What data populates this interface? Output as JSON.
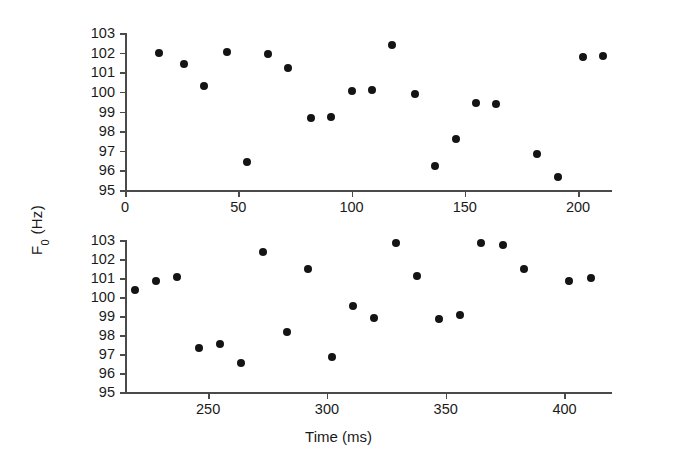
{
  "chart_data": {
    "type": "scatter",
    "title": "",
    "xlabel": "Time (ms)",
    "ylabel": "F0 (Hz)",
    "ylabel_base": "F",
    "ylabel_sub": "0",
    "ylabel_unit": " (Hz)",
    "grid": false,
    "legend": "none",
    "marker": "filled-circle",
    "marker_color": "#141414",
    "axis_color": "#4a4a4a",
    "panels": [
      {
        "name": "top-panel",
        "xlim": [
          0,
          215
        ],
        "ylim": [
          95,
          103
        ],
        "xticks": [
          0,
          50,
          100,
          150,
          200
        ],
        "xtick_labels": [
          "0",
          "50",
          "100",
          "150",
          "200"
        ],
        "yticks": [
          95,
          96,
          97,
          98,
          99,
          100,
          101,
          102,
          103
        ],
        "ytick_labels": [
          "95",
          "96",
          "97",
          "98",
          "99",
          "100",
          "101",
          "102",
          "103"
        ],
        "x": [
          15,
          26,
          35,
          45,
          54,
          63,
          72,
          82,
          91,
          100,
          109,
          118,
          128,
          137,
          146,
          155,
          164,
          182,
          191,
          202,
          211
        ],
        "y": [
          102.0,
          101.4,
          100.3,
          102.05,
          96.45,
          101.95,
          101.2,
          98.65,
          98.7,
          100.05,
          100.1,
          102.4,
          99.9,
          96.2,
          97.6,
          99.45,
          99.4,
          96.85,
          95.65,
          101.8,
          101.85
        ]
      },
      {
        "name": "bottom-panel",
        "xlim": [
          215,
          420
        ],
        "ylim": [
          95,
          103
        ],
        "xticks": [
          250,
          300,
          350,
          400
        ],
        "xtick_labels": [
          "250",
          "300",
          "350",
          "400"
        ],
        "yticks": [
          95,
          96,
          97,
          98,
          99,
          100,
          101,
          102,
          103
        ],
        "ytick_labels": [
          "95",
          "96",
          "97",
          "98",
          "99",
          "100",
          "101",
          "102",
          "103"
        ],
        "x": [
          219,
          228,
          237,
          246,
          255,
          264,
          273,
          283,
          292,
          302,
          311,
          320,
          329,
          338,
          347,
          356,
          365,
          374,
          383,
          402,
          411
        ],
        "y": [
          100.35,
          100.85,
          101.05,
          97.3,
          97.55,
          96.55,
          102.35,
          98.15,
          101.5,
          96.85,
          99.55,
          98.9,
          102.85,
          101.1,
          98.85,
          99.05,
          102.85,
          102.75,
          101.5,
          100.85,
          101.0
        ]
      }
    ]
  }
}
